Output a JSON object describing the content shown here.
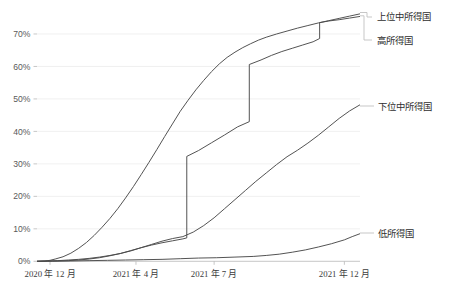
{
  "chart_data": {
    "type": "line",
    "title": "",
    "subtitle": "",
    "xlabel": "",
    "ylabel": "",
    "ylim": [
      0,
      78
    ],
    "grid": true,
    "legend_position": "right-inline-labels",
    "y_ticks": [
      "0%",
      "10%",
      "20%",
      "30%",
      "40%",
      "50%",
      "60%",
      "70%"
    ],
    "y_tick_values": [
      0,
      10,
      20,
      30,
      40,
      50,
      60,
      70
    ],
    "x_ticks": [
      "2020 年 12 月",
      "2021 年 4 月",
      "2021 年 7 月",
      "2021 年 12 月"
    ],
    "x_tick_positions": [
      0.7,
      4.0,
      7.0,
      12.0
    ],
    "x_range": [
      0.2,
      12.6
    ],
    "series": [
      {
        "name": "高所得国",
        "style": "smooth",
        "end_value": 76.2,
        "x": [
          0.2,
          0.5,
          0.7,
          0.9,
          1.2,
          1.5,
          1.8,
          2.1,
          2.4,
          2.7,
          3.0,
          3.3,
          3.6,
          3.9,
          4.2,
          4.5,
          4.8,
          5.1,
          5.4,
          5.7,
          6.0,
          6.3,
          6.6,
          6.9,
          7.2,
          7.5,
          7.8,
          8.1,
          8.4,
          8.7,
          9.0,
          9.4,
          9.8,
          10.2,
          10.6,
          11.0,
          11.4,
          11.8,
          12.2,
          12.6
        ],
        "values": [
          0.0,
          0.1,
          0.3,
          0.7,
          1.4,
          2.5,
          4.0,
          5.8,
          8.0,
          10.5,
          13.2,
          16.2,
          19.5,
          23.0,
          26.7,
          30.5,
          34.4,
          38.4,
          42.3,
          46.2,
          49.6,
          52.8,
          55.7,
          58.4,
          60.8,
          62.8,
          64.4,
          65.8,
          67.0,
          68.1,
          69.0,
          70.0,
          70.9,
          71.8,
          72.6,
          73.4,
          74.1,
          74.8,
          75.5,
          76.2
        ]
      },
      {
        "name": "上位中所得国",
        "style": "stepped",
        "end_value": 75.4,
        "x": [
          0.2,
          0.6,
          1.0,
          1.4,
          1.8,
          2.2,
          2.6,
          3.0,
          3.4,
          3.8,
          4.2,
          4.6,
          5.0,
          5.4,
          5.8,
          5.95,
          5.95,
          6.4,
          6.9,
          7.4,
          7.9,
          8.35,
          8.35,
          8.8,
          9.2,
          9.6,
          10.0,
          10.4,
          10.8,
          11.05,
          11.05,
          11.4,
          11.8,
          12.2,
          12.6
        ],
        "values": [
          0.0,
          0.05,
          0.1,
          0.2,
          0.4,
          0.7,
          1.1,
          1.7,
          2.4,
          3.3,
          4.2,
          5.0,
          5.7,
          6.3,
          6.9,
          7.2,
          32.3,
          34.1,
          36.5,
          38.9,
          41.4,
          43.0,
          60.6,
          62.0,
          63.4,
          64.6,
          65.6,
          66.6,
          67.6,
          68.6,
          73.5,
          74.0,
          74.4,
          74.9,
          75.4
        ]
      },
      {
        "name": "下位中所得国",
        "style": "smooth",
        "end_value": 48.2,
        "x": [
          0.2,
          0.6,
          1.0,
          1.4,
          1.8,
          2.2,
          2.6,
          3.0,
          3.4,
          3.8,
          4.2,
          4.6,
          5.0,
          5.4,
          5.8,
          6.2,
          6.6,
          7.0,
          7.4,
          7.8,
          8.2,
          8.6,
          9.0,
          9.4,
          9.8,
          10.2,
          10.6,
          11.0,
          11.4,
          11.8,
          12.2,
          12.6
        ],
        "values": [
          0.0,
          0.1,
          0.2,
          0.4,
          0.6,
          0.9,
          1.3,
          1.8,
          2.4,
          3.2,
          4.2,
          5.2,
          6.2,
          7.0,
          7.6,
          9.0,
          11.0,
          13.4,
          16.2,
          19.0,
          21.8,
          24.6,
          27.2,
          29.8,
          32.2,
          34.2,
          36.4,
          38.8,
          41.4,
          44.0,
          46.3,
          48.2
        ]
      },
      {
        "name": "低所得国",
        "style": "smooth",
        "end_value": 8.5,
        "x": [
          0.2,
          0.8,
          1.5,
          2.2,
          2.9,
          3.6,
          4.3,
          5.0,
          5.7,
          6.4,
          7.1,
          7.8,
          8.5,
          9.0,
          9.5,
          10.0,
          10.5,
          11.0,
          11.5,
          12.0,
          12.3,
          12.6
        ],
        "values": [
          0.0,
          0.05,
          0.1,
          0.2,
          0.3,
          0.4,
          0.5,
          0.6,
          0.8,
          1.0,
          1.1,
          1.3,
          1.5,
          1.8,
          2.2,
          2.8,
          3.5,
          4.4,
          5.4,
          6.6,
          7.6,
          8.5
        ]
      }
    ]
  },
  "labels": {
    "upper_middle": "上位中所得国",
    "high": "高所得国",
    "lower_middle": "下位中所得国",
    "low": "低所得国"
  },
  "colors": {
    "line": "#4a4a4a",
    "grid": "#ececec",
    "axis": "#b9b9b9",
    "leader": "#bdbdbd",
    "text": "#2e2e2e",
    "background": "#ffffff"
  }
}
